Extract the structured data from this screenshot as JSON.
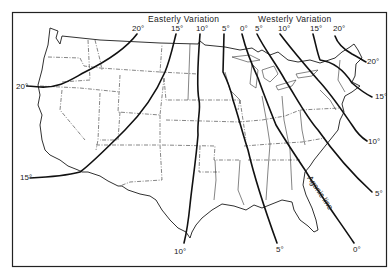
{
  "map": {
    "title_regions": {
      "easterly": "Easterly  Variation",
      "westerly": "Westerly  Variation"
    },
    "agonic_label": "Agonic line",
    "isogonic_lines": [
      {
        "id": "e20",
        "side": "easterly",
        "value": "20°",
        "labels": [
          {
            "text": "20°",
            "x": 132,
            "y": 31
          },
          {
            "text": "20°",
            "x": 16,
            "y": 89
          }
        ],
        "path": "M137 34 C 125 50, 105 62, 85 72 C 70 80, 60 88, 40 87 C 30 86, 24 86, 28 86"
      },
      {
        "id": "e15",
        "side": "easterly",
        "value": "15°",
        "labels": [
          {
            "text": "15°",
            "x": 171,
            "y": 31
          },
          {
            "text": "15°",
            "x": 20,
            "y": 180
          }
        ],
        "path": "M176 34 C 172 50, 170 60, 165 72 C 155 95, 140 115, 125 130 C 105 150, 90 165, 80 172 C 65 176, 50 177, 30 178"
      },
      {
        "id": "e10",
        "side": "easterly",
        "value": "10°",
        "labels": [
          {
            "text": "10°",
            "x": 196,
            "y": 31
          },
          {
            "text": "10°",
            "x": 174,
            "y": 254
          }
        ],
        "path": "M200 34 C 198 60, 197 90, 199 100 C 201 110, 197 120, 198 135 C 196 160, 192 185, 190 205 C 188 225, 186 235, 184 243"
      },
      {
        "id": "e5",
        "side": "easterly",
        "value": "5°",
        "labels": [
          {
            "text": "5°",
            "x": 222,
            "y": 31
          },
          {
            "text": "5°",
            "x": 276,
            "y": 252
          }
        ],
        "path": "M224 34 L 223 72 C 227 80, 231 90, 233 100 C 238 115, 243 135, 248 150 C 255 180, 265 210, 277 243"
      },
      {
        "id": "w0",
        "side": "agonic",
        "value": "0°",
        "labels": [
          {
            "text": "0°",
            "x": 240,
            "y": 31
          },
          {
            "text": "0°",
            "x": 353,
            "y": 252
          }
        ],
        "path": "M242 34 C 246 50, 252 65, 258 78 C 264 95, 270 110, 276 125 C 285 140, 295 155, 305 170 C 320 195, 340 222, 354 243"
      },
      {
        "id": "w5",
        "side": "westerly",
        "value": "5°",
        "labels": [
          {
            "text": "5°",
            "x": 255,
            "y": 31
          },
          {
            "text": "5°",
            "x": 375,
            "y": 196
          }
        ],
        "path": "M257 34 C 265 50, 275 62, 285 80 C 295 95, 305 115, 318 130 C 332 150, 348 170, 372 192"
      },
      {
        "id": "w10",
        "side": "westerly",
        "value": "10°",
        "labels": [
          {
            "text": "10°",
            "x": 278,
            "y": 31
          },
          {
            "text": "10°",
            "x": 368,
            "y": 144
          }
        ],
        "path": "M280 34 C 292 50, 305 65, 318 80 C 332 95, 345 115, 352 125 C 357 133, 362 138, 367 141"
      },
      {
        "id": "w15",
        "side": "westerly",
        "value": "15°",
        "labels": [
          {
            "text": "15°",
            "x": 310,
            "y": 31
          },
          {
            "text": "15°",
            "x": 375,
            "y": 99
          }
        ],
        "path": "M313 34 C 316 45, 317 52, 320 60 C 335 62, 345 72, 352 83 C 360 90, 366 94, 372 97"
      },
      {
        "id": "w20",
        "side": "westerly",
        "value": "20°",
        "labels": [
          {
            "text": "20°",
            "x": 333,
            "y": 31
          },
          {
            "text": "20°",
            "x": 367,
            "y": 64
          }
        ],
        "path": "M335 36 C 338 45, 345 50, 352 54 C 358 57, 362 60, 366 62"
      }
    ],
    "colors": {
      "ink": "#111111",
      "background": "#ffffff"
    }
  }
}
